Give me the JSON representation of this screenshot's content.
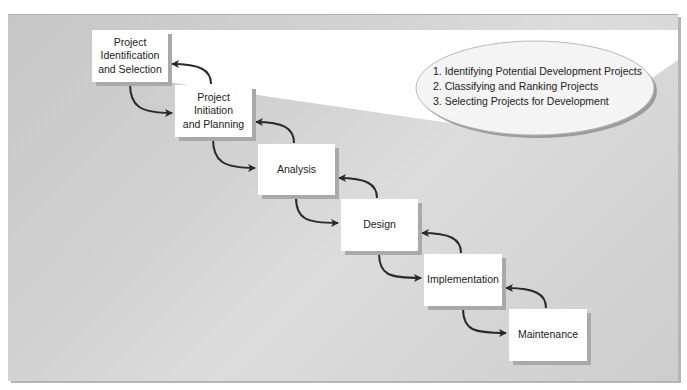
{
  "diagram": {
    "caption": "",
    "phases": [
      {
        "label": "Project\nIdentification\nand Selection"
      },
      {
        "label": "Project\nInitiation\nand Planning"
      },
      {
        "label": "Analysis"
      },
      {
        "label": "Design"
      },
      {
        "label": "Implementation"
      },
      {
        "label": "Maintenance"
      }
    ],
    "callout": {
      "items": [
        "1. Identifying Potential Development Projects",
        "2. Classifying and Ranking Projects",
        "3. Selecting Projects for Development"
      ]
    },
    "colors": {
      "background": "#cfcfcf",
      "box": "#ffffff",
      "box_shadow": "#a9a9a9",
      "arrow": "#2a2a2a",
      "callout_fill": "#f4f4f4"
    }
  }
}
